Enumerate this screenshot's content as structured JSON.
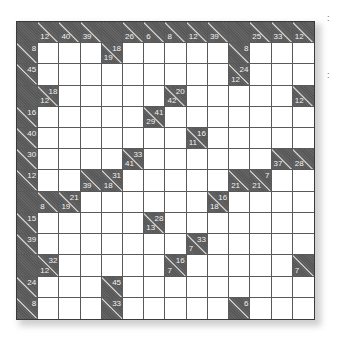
{
  "puzzle": {
    "type": "kakuro",
    "size": 14,
    "colors": {
      "dark": "#5c5c5c",
      "white": "#ffffff",
      "clue_text": "#f2f2f2",
      "grid_line": "#5a5a5a"
    },
    "legend": "cell: 'W' = white entry cell, 'X' = blank block, otherwise {a: across sum, d: down sum}",
    "rows": [
      [
        "X",
        {
          "d": "12"
        },
        {
          "d": "40"
        },
        {
          "d": "39"
        },
        "X",
        {
          "d": "26"
        },
        {
          "d": "6"
        },
        {
          "d": "8"
        },
        {
          "d": "12"
        },
        {
          "d": "39"
        },
        "X",
        {
          "d": "25"
        },
        {
          "d": "33"
        },
        {
          "d": "12"
        }
      ],
      [
        {
          "a": "8"
        },
        "W",
        "W",
        "W",
        {
          "a": "18",
          "d": "19"
        },
        "W",
        "W",
        "W",
        "W",
        "W",
        {
          "a": "8"
        },
        "W",
        "W",
        "W"
      ],
      [
        {
          "a": "45"
        },
        "W",
        "W",
        "W",
        "W",
        "W",
        "W",
        "W",
        "W",
        "W",
        {
          "a": "24",
          "d": "12"
        },
        "W",
        "W",
        "W"
      ],
      [
        "X",
        {
          "a": "18",
          "d": "12"
        },
        "W",
        "W",
        "W",
        "W",
        "W",
        {
          "a": "20",
          "d": "42"
        },
        "W",
        "W",
        "W",
        "W",
        "W",
        {
          "d": "12"
        }
      ],
      [
        {
          "a": "16"
        },
        "W",
        "W",
        "W",
        "W",
        "W",
        {
          "a": "41",
          "d": "29"
        },
        "W",
        "W",
        "W",
        "W",
        "W",
        "W",
        "W"
      ],
      [
        {
          "a": "40"
        },
        "W",
        "W",
        "W",
        "W",
        "W",
        "W",
        "W",
        {
          "a": "16",
          "d": "11"
        },
        "W",
        "W",
        "W",
        "W",
        "W"
      ],
      [
        {
          "a": "30"
        },
        "W",
        "W",
        "W",
        "W",
        {
          "a": "33",
          "d": "41"
        },
        "W",
        "W",
        "W",
        "W",
        "W",
        "W",
        {
          "d": "37"
        },
        {
          "d": "28"
        }
      ],
      [
        {
          "a": "12"
        },
        "W",
        "W",
        {
          "d": "39"
        },
        {
          "a": "31",
          "d": "18"
        },
        "W",
        "W",
        "W",
        "W",
        "W",
        {
          "d": "21"
        },
        {
          "a": "7",
          "d": "21"
        },
        "W",
        "W"
      ],
      [
        "X",
        {
          "d": "8"
        },
        {
          "a": "21",
          "d": "19"
        },
        "W",
        "W",
        "W",
        "W",
        "W",
        "W",
        {
          "a": "16",
          "d": "18"
        },
        "W",
        "W",
        "W",
        "W"
      ],
      [
        {
          "a": "15"
        },
        "W",
        "W",
        "W",
        "W",
        "W",
        {
          "a": "28",
          "d": "13"
        },
        "W",
        "W",
        "W",
        "W",
        "W",
        "W",
        "W"
      ],
      [
        {
          "a": "39"
        },
        "W",
        "W",
        "W",
        "W",
        "W",
        "W",
        "W",
        {
          "a": "33",
          "d": "7"
        },
        "W",
        "W",
        "W",
        "W",
        "W"
      ],
      [
        "X",
        {
          "a": "32",
          "d": "12"
        },
        "W",
        "W",
        "W",
        "W",
        "W",
        {
          "a": "16",
          "d": "7"
        },
        "W",
        "W",
        "W",
        "W",
        "W",
        {
          "d": "7"
        }
      ],
      [
        {
          "a": "24"
        },
        "W",
        "W",
        "W",
        {
          "a": "45"
        },
        "W",
        "W",
        "W",
        "W",
        "W",
        "W",
        "W",
        "W",
        "W"
      ],
      [
        {
          "a": "8"
        },
        "W",
        "W",
        "W",
        {
          "a": "33"
        },
        "W",
        "W",
        "W",
        "W",
        "W",
        {
          "a": "6"
        },
        "W",
        "W",
        "W"
      ]
    ]
  },
  "margin_marks": [
    {
      "label": ":",
      "y": 14
    },
    {
      "label": ":",
      "y": 71
    }
  ]
}
